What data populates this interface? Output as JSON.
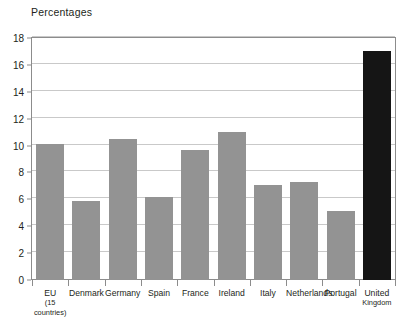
{
  "chart_data": {
    "type": "bar",
    "title": "Percentages",
    "xlabel": "",
    "ylabel": "",
    "ylim": [
      0,
      18
    ],
    "ytick_step": 2,
    "yticks": [
      0,
      2,
      4,
      6,
      8,
      10,
      12,
      14,
      16,
      18
    ],
    "ytick_labels": [
      "0",
      "2",
      "4",
      "6",
      "8",
      "10",
      "12",
      "14",
      "16",
      "18"
    ],
    "grid": true,
    "grid_axis": "y",
    "legend": false,
    "categories": [
      "EU",
      "Denmark",
      "Germany",
      "Spain",
      "France",
      "Ireland",
      "Italy",
      "Netherlands",
      "Portugal",
      "United Kingdom"
    ],
    "category_labels": [
      {
        "line1": "EU",
        "line2": "(15 countries)"
      },
      {
        "line1": "Denmark",
        "line2": ""
      },
      {
        "line1": "Germany",
        "line2": ""
      },
      {
        "line1": "Spain",
        "line2": ""
      },
      {
        "line1": "France",
        "line2": ""
      },
      {
        "line1": "Ireland",
        "line2": ""
      },
      {
        "line1": "Italy",
        "line2": ""
      },
      {
        "line1": "Netherlands",
        "line2": ""
      },
      {
        "line1": "Portugal",
        "line2": ""
      },
      {
        "line1": "United",
        "line2": "Kingdom"
      }
    ],
    "values": [
      10.1,
      5.9,
      10.5,
      6.2,
      9.7,
      11.0,
      7.1,
      7.3,
      5.1,
      17.0
    ],
    "bar_colors": [
      "#939393",
      "#939393",
      "#939393",
      "#939393",
      "#939393",
      "#939393",
      "#939393",
      "#939393",
      "#939393",
      "#151515"
    ],
    "highlight_index": 9,
    "colors": {
      "bar": "#939393",
      "bar_highlight": "#151515",
      "grid": "#c9c9c9",
      "frame": "#8c8c8c",
      "text": "#231f20",
      "background": "#ffffff"
    }
  }
}
